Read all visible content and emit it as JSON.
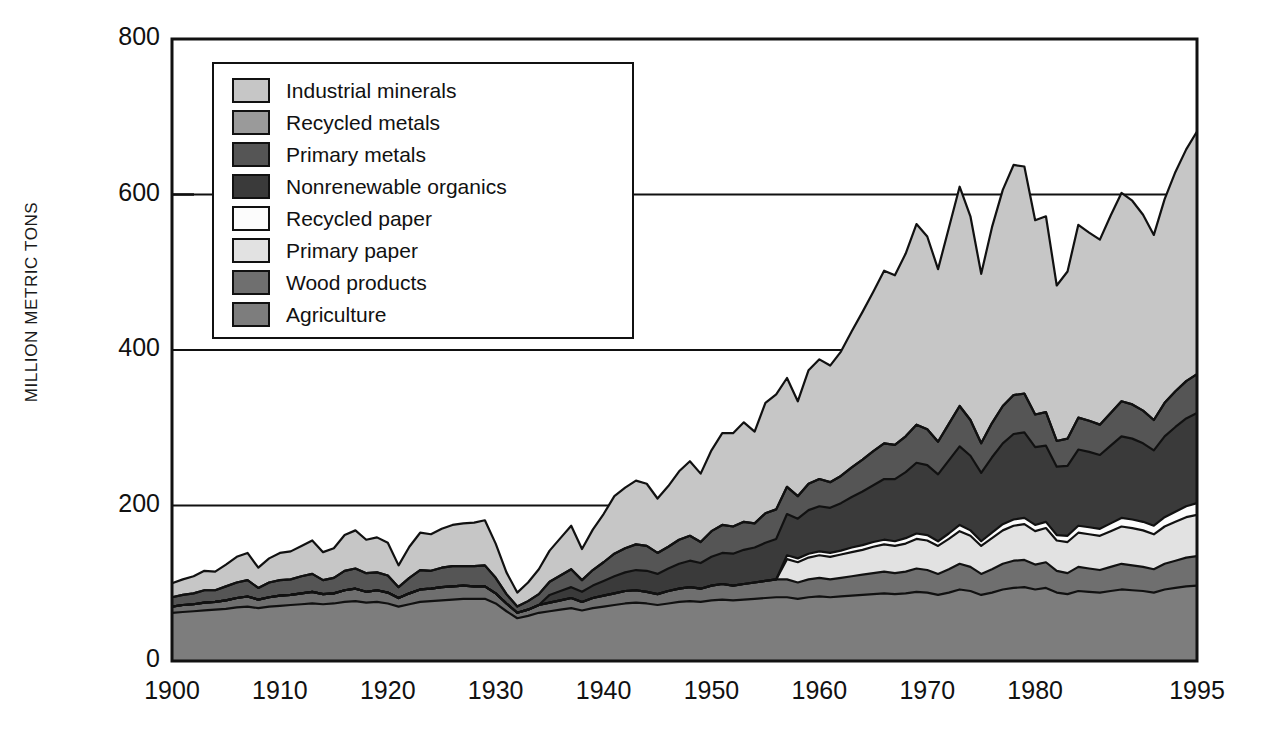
{
  "chart_data": {
    "type": "area",
    "title": "",
    "subtitle": "",
    "xlabel": "",
    "ylabel": "MILLION METRIC TONS",
    "xlim": [
      1900,
      1995
    ],
    "ylim": [
      0,
      800
    ],
    "x_ticks": [
      1900,
      1910,
      1920,
      1930,
      1940,
      1950,
      1960,
      1970,
      1980,
      1995
    ],
    "y_ticks": [
      0,
      200,
      400,
      600,
      800
    ],
    "grid": "horizontal-gridlines-at-200-400-600",
    "legend_position": "upper-left-inside",
    "stacked": true,
    "stack_order_bottom_to_top": [
      "Agriculture",
      "Wood products",
      "Primary paper",
      "Recycled paper",
      "Nonrenewable organics",
      "Primary metals",
      "Recycled metals",
      "Industrial minerals"
    ],
    "x": [
      1900,
      1901,
      1902,
      1903,
      1904,
      1905,
      1906,
      1907,
      1908,
      1909,
      1910,
      1911,
      1912,
      1913,
      1914,
      1915,
      1916,
      1917,
      1918,
      1919,
      1920,
      1921,
      1922,
      1923,
      1924,
      1925,
      1926,
      1927,
      1928,
      1929,
      1930,
      1931,
      1932,
      1933,
      1934,
      1935,
      1936,
      1937,
      1938,
      1939,
      1940,
      1941,
      1942,
      1943,
      1944,
      1945,
      1946,
      1947,
      1948,
      1949,
      1950,
      1951,
      1952,
      1953,
      1954,
      1955,
      1956,
      1957,
      1958,
      1959,
      1960,
      1961,
      1962,
      1963,
      1964,
      1965,
      1966,
      1967,
      1968,
      1969,
      1970,
      1971,
      1972,
      1973,
      1974,
      1975,
      1976,
      1977,
      1978,
      1979,
      1980,
      1981,
      1982,
      1983,
      1984,
      1985,
      1986,
      1987,
      1988,
      1989,
      1990,
      1991,
      1992,
      1993,
      1994,
      1995
    ],
    "series": [
      {
        "name": "Agriculture",
        "color": "#7d7d7d",
        "values": [
          62,
          63,
          64,
          65,
          66,
          67,
          69,
          70,
          68,
          70,
          71,
          72,
          73,
          74,
          73,
          74,
          76,
          77,
          75,
          76,
          74,
          70,
          73,
          76,
          77,
          78,
          79,
          80,
          80,
          80,
          74,
          64,
          55,
          58,
          62,
          64,
          66,
          68,
          65,
          68,
          70,
          72,
          74,
          75,
          74,
          72,
          74,
          76,
          77,
          76,
          78,
          79,
          78,
          79,
          80,
          81,
          82,
          82,
          80,
          82,
          83,
          82,
          83,
          84,
          85,
          86,
          87,
          86,
          87,
          89,
          88,
          85,
          88,
          92,
          90,
          85,
          88,
          92,
          94,
          95,
          92,
          94,
          88,
          86,
          90,
          89,
          88,
          90,
          92,
          91,
          90,
          88,
          92,
          94,
          96,
          97
        ]
      },
      {
        "name": "Wood products",
        "color": "#6f6f6f",
        "values": [
          8,
          9,
          9,
          10,
          10,
          11,
          12,
          13,
          11,
          12,
          13,
          13,
          14,
          15,
          13,
          13,
          15,
          16,
          14,
          15,
          14,
          11,
          14,
          16,
          16,
          17,
          17,
          17,
          16,
          16,
          13,
          10,
          7,
          8,
          10,
          11,
          12,
          13,
          11,
          13,
          14,
          15,
          16,
          16,
          15,
          14,
          16,
          17,
          18,
          17,
          19,
          20,
          19,
          20,
          21,
          22,
          23,
          23,
          21,
          23,
          24,
          23,
          24,
          25,
          26,
          27,
          28,
          27,
          28,
          30,
          29,
          27,
          30,
          33,
          31,
          27,
          30,
          33,
          35,
          35,
          32,
          33,
          28,
          27,
          31,
          30,
          29,
          31,
          33,
          32,
          31,
          30,
          33,
          35,
          37,
          38
        ]
      },
      {
        "name": "Primary paper",
        "color": "#e2e2e2",
        "values": [
          0,
          0,
          0,
          0,
          0,
          0,
          0,
          0,
          0,
          0,
          0,
          0,
          0,
          0,
          0,
          0,
          0,
          0,
          0,
          0,
          0,
          0,
          0,
          0,
          0,
          0,
          0,
          0,
          0,
          0,
          0,
          0,
          0,
          0,
          0,
          0,
          0,
          0,
          0,
          0,
          0,
          0,
          0,
          0,
          0,
          0,
          0,
          0,
          0,
          0,
          0,
          0,
          0,
          0,
          0,
          0,
          0,
          26,
          26,
          28,
          29,
          29,
          30,
          31,
          32,
          34,
          35,
          35,
          36,
          38,
          38,
          36,
          39,
          42,
          40,
          36,
          40,
          43,
          45,
          46,
          43,
          44,
          39,
          40,
          44,
          44,
          44,
          46,
          48,
          48,
          47,
          45,
          48,
          50,
          52,
          53
        ]
      },
      {
        "name": "Recycled paper",
        "color": "#fcfcfc",
        "values": [
          0,
          0,
          0,
          0,
          0,
          0,
          0,
          0,
          0,
          0,
          0,
          0,
          0,
          0,
          0,
          0,
          0,
          0,
          0,
          0,
          0,
          0,
          0,
          0,
          0,
          0,
          0,
          0,
          0,
          0,
          0,
          0,
          0,
          0,
          0,
          0,
          0,
          0,
          0,
          0,
          0,
          0,
          0,
          0,
          0,
          0,
          0,
          0,
          0,
          0,
          0,
          0,
          0,
          0,
          0,
          0,
          0,
          5,
          5,
          5,
          5,
          5,
          5,
          6,
          6,
          6,
          6,
          6,
          7,
          7,
          7,
          6,
          7,
          8,
          7,
          6,
          7,
          8,
          8,
          8,
          8,
          8,
          7,
          8,
          9,
          9,
          9,
          10,
          11,
          11,
          11,
          11,
          12,
          13,
          14,
          15
        ]
      },
      {
        "name": "Nonrenewable organics",
        "color": "#3a3a3a",
        "values": [
          0,
          0,
          0,
          0,
          0,
          0,
          0,
          0,
          0,
          0,
          0,
          0,
          0,
          0,
          0,
          0,
          0,
          0,
          0,
          0,
          0,
          0,
          0,
          0,
          0,
          0,
          0,
          0,
          0,
          0,
          0,
          0,
          0,
          0,
          0,
          10,
          12,
          14,
          13,
          16,
          19,
          22,
          24,
          26,
          27,
          26,
          29,
          32,
          34,
          33,
          37,
          40,
          41,
          44,
          45,
          49,
          52,
          53,
          51,
          56,
          58,
          58,
          61,
          65,
          69,
          73,
          78,
          80,
          85,
          91,
          90,
          86,
          94,
          101,
          96,
          88,
          97,
          104,
          110,
          110,
          100,
          98,
          88,
          90,
          98,
          97,
          95,
          100,
          105,
          104,
          101,
          97,
          104,
          109,
          113,
          116
        ]
      },
      {
        "name": "Primary metals",
        "color": "#555555",
        "values": [
          12,
          13,
          14,
          16,
          15,
          18,
          20,
          21,
          15,
          19,
          20,
          20,
          22,
          23,
          18,
          20,
          25,
          26,
          24,
          23,
          22,
          14,
          20,
          25,
          23,
          25,
          26,
          25,
          26,
          27,
          20,
          12,
          8,
          11,
          14,
          17,
          20,
          23,
          15,
          20,
          24,
          29,
          31,
          33,
          32,
          27,
          28,
          31,
          32,
          27,
          33,
          36,
          35,
          36,
          31,
          38,
          38,
          35,
          29,
          34,
          35,
          33,
          35,
          38,
          41,
          44,
          46,
          44,
          46,
          49,
          46,
          42,
          47,
          52,
          46,
          38,
          44,
          48,
          50,
          50,
          42,
          43,
          33,
          35,
          41,
          40,
          39,
          42,
          45,
          44,
          42,
          39,
          43,
          46,
          48,
          50
        ]
      },
      {
        "name": "Recycled metals",
        "color": "#9a9a9a",
        "values": [
          0,
          0,
          0,
          0,
          0,
          0,
          0,
          0,
          0,
          0,
          0,
          0,
          0,
          0,
          0,
          0,
          0,
          0,
          0,
          0,
          0,
          0,
          0,
          0,
          0,
          0,
          0,
          0,
          0,
          0,
          0,
          0,
          0,
          0,
          0,
          0,
          0,
          0,
          0,
          0,
          0,
          0,
          0,
          0,
          0,
          0,
          0,
          0,
          0,
          0,
          0,
          0,
          0,
          0,
          0,
          0,
          0,
          0,
          0,
          0,
          0,
          0,
          0,
          0,
          0,
          0,
          0,
          0,
          0,
          0,
          0,
          0,
          0,
          0,
          0,
          0,
          0,
          0,
          0,
          0,
          0,
          0,
          0,
          0,
          0,
          0,
          0,
          0,
          0,
          0,
          0,
          0,
          0,
          0,
          0,
          0
        ]
      },
      {
        "name": "Industrial minerals",
        "color": "#c6c6c6",
        "values": [
          18,
          20,
          22,
          25,
          24,
          28,
          33,
          35,
          26,
          31,
          35,
          36,
          39,
          43,
          36,
          38,
          46,
          49,
          43,
          45,
          42,
          28,
          40,
          48,
          47,
          50,
          53,
          55,
          56,
          58,
          44,
          28,
          18,
          24,
          32,
          40,
          48,
          56,
          40,
          52,
          62,
          74,
          78,
          82,
          80,
          70,
          78,
          88,
          96,
          88,
          104,
          118,
          120,
          128,
          118,
          142,
          148,
          140,
          122,
          146,
          154,
          150,
          160,
          175,
          190,
          205,
          222,
          218,
          235,
          258,
          248,
          222,
          252,
          282,
          262,
          218,
          252,
          278,
          296,
          292,
          250,
          252,
          200,
          215,
          248,
          242,
          238,
          254,
          268,
          262,
          252,
          238,
          262,
          282,
          298,
          312
        ]
      }
    ]
  },
  "legend": {
    "items": [
      {
        "label": "Industrial minerals",
        "color": "#c6c6c6"
      },
      {
        "label": "Recycled metals",
        "color": "#9a9a9a"
      },
      {
        "label": "Primary metals",
        "color": "#555555"
      },
      {
        "label": "Nonrenewable organics",
        "color": "#3a3a3a"
      },
      {
        "label": "Recycled paper",
        "color": "#fcfcfc"
      },
      {
        "label": "Primary paper",
        "color": "#e2e2e2"
      },
      {
        "label": "Wood products",
        "color": "#6f6f6f"
      },
      {
        "label": "Agriculture",
        "color": "#7d7d7d"
      }
    ]
  },
  "axis": {
    "y_label": "MILLION METRIC TONS",
    "y_ticks": [
      "800",
      "600",
      "400",
      "200",
      "0"
    ],
    "x_ticks": [
      "1900",
      "1910",
      "1920",
      "1930",
      "1940",
      "1950",
      "1960",
      "1970",
      "1980",
      "1995"
    ]
  }
}
